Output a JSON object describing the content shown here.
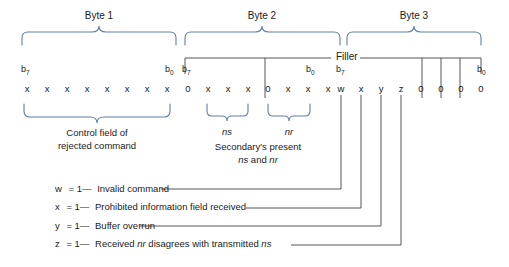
{
  "diagram": {
    "byte_headers": [
      {
        "label": "Byte 1"
      },
      {
        "label": "Byte 2"
      },
      {
        "label": "Byte 3"
      }
    ],
    "filler_label": "Filler",
    "bit_edge_labels": {
      "b7": "b",
      "b7_sub": "7",
      "b0": "b",
      "b0_sub": "0"
    },
    "bytes": [
      {
        "name": "byte-1",
        "bits": [
          "x",
          "x",
          "x",
          "x",
          "x",
          "x",
          "x",
          "x"
        ]
      },
      {
        "name": "byte-2",
        "bits": [
          "0",
          "x",
          "x",
          "x",
          "0",
          "x",
          "x",
          "x"
        ]
      },
      {
        "name": "byte-3",
        "bits": [
          "w",
          "x",
          "y",
          "z",
          "0",
          "0",
          "0",
          "0"
        ]
      }
    ],
    "field_labels": {
      "control_field_line1": "Control field of",
      "control_field_line2": "rejected command",
      "ns": "ns",
      "nr": "nr",
      "secondary_line1": "Secondary's present",
      "secondary_line2_pre": "ns",
      "secondary_line2_mid": " and ",
      "secondary_line2_post": "nr"
    },
    "legend": [
      {
        "symbol": "w",
        "eq": "= 1—",
        "text": "Invalid command"
      },
      {
        "symbol": "x",
        "eq": "= 1—",
        "text": "Prohibited information field received"
      },
      {
        "symbol": "y",
        "eq": "= 1—",
        "text": "Buffer overrun"
      },
      {
        "symbol": "z",
        "eq": "= 1—",
        "text_pre": "Received ",
        "text_ital1": "nr",
        "text_mid": " disagrees with transmitted ",
        "text_ital2": "ns"
      }
    ],
    "colors": {
      "brace": "#5f7ea8",
      "line": "#555555",
      "text": "#1a1a1a",
      "background": "#ffffff"
    }
  }
}
